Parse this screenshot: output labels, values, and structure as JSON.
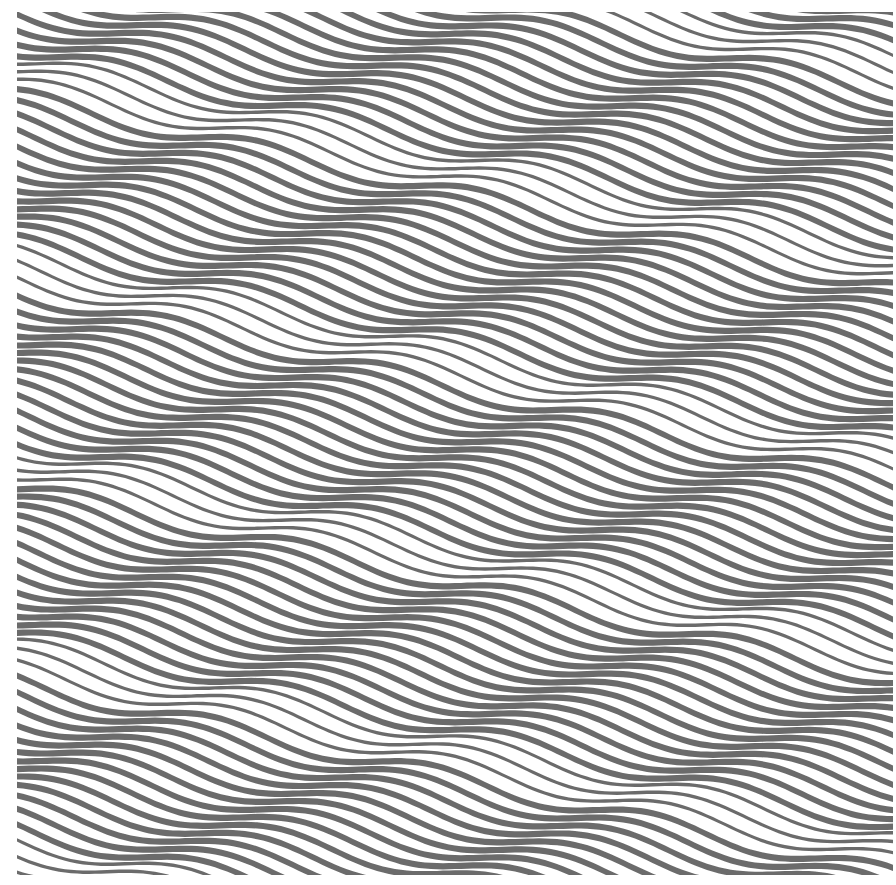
{
  "artwork": {
    "title": "Op-art wavy stripe pattern",
    "background": "#ffffff",
    "stripe_color": "#6b6b6b",
    "width": 876,
    "height": 863,
    "stripe_spacing": 12.2,
    "stripe_thickness": 6.2,
    "wavelength": 220,
    "amplitude": 9,
    "slope": 0.0,
    "phase_drift_per_stripe": 0.55,
    "pinch_every": 16
  }
}
